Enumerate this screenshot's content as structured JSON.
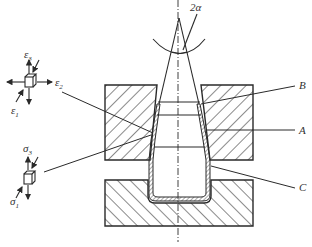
{
  "diagram": {
    "type": "spinning / flow-forming cross-section",
    "labels": {
      "angle": "2α",
      "B": "B",
      "A": "A",
      "C": "C"
    },
    "strain_element": {
      "eps3": "ε",
      "eps3_sub": "3",
      "eps2": "ε",
      "eps2_sub": "2",
      "eps1": "ε",
      "eps1_sub": "1"
    },
    "stress_element": {
      "sig3": "σ",
      "sig3_sub": "3",
      "sig1": "σ",
      "sig1_sub": "1"
    },
    "colors": {
      "line": "#2a2a2a",
      "background": "#ffffff"
    }
  }
}
